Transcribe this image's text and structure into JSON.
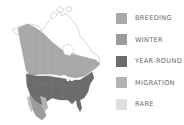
{
  "map": {
    "region": "North America",
    "colors": {
      "breeding": "#a9a9a9",
      "winter": "#9b9b9b",
      "year_round": "#6c6c6c",
      "migration": "#b3b3b3",
      "rare": "#dedede",
      "land": "#ffffff",
      "borders": "#8a8a8a"
    }
  },
  "legend": {
    "items": [
      {
        "label": "BREEDING",
        "color": "#a9a9a9"
      },
      {
        "label": "WINTER",
        "color": "#9b9b9b"
      },
      {
        "label": "YEAR-ROUND",
        "color": "#6c6c6c"
      },
      {
        "label": "MIGRATION",
        "color": "#b3b3b3"
      },
      {
        "label": "RARE",
        "color": "#dedede"
      }
    ]
  }
}
